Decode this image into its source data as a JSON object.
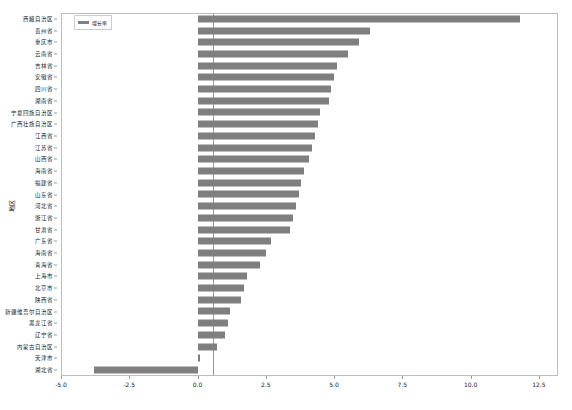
{
  "chart_data": {
    "type": "bar",
    "orientation": "horizontal",
    "title": "",
    "xlabel": "",
    "ylabel": "地区",
    "xlim": [
      -5.0,
      13.2
    ],
    "xticks": [
      "-5.0",
      "-2.5",
      "0.0",
      "2.5",
      "5.0",
      "7.5",
      "10.0",
      "12.5"
    ],
    "xtick_values": [
      -5.0,
      -2.5,
      0.0,
      2.5,
      5.0,
      7.5,
      10.0,
      12.5
    ],
    "grid": false,
    "legend": {
      "position": "upper left",
      "entries": [
        {
          "label": "增长率",
          "color": "#7f7f7f"
        }
      ]
    },
    "bar_color": "#7f7f7f",
    "categories": [
      "西藏自治区",
      "贵州省",
      "重庆市",
      "云南省",
      "吉林省",
      "安徽省",
      "四川省",
      "湖南省",
      "宁夏回族自治区",
      "广西壮族自治区",
      "江西省",
      "江苏省",
      "山西省",
      "海南省",
      "福建省",
      "山东省",
      "河北省",
      "浙江省",
      "甘肃省",
      "广东省",
      "海南省",
      "青海省",
      "上海市",
      "北京市",
      "陕西省",
      "新疆维吾尔自治区",
      "黑龙江省",
      "辽宁省",
      "内蒙古自治区",
      "天津市",
      "湖北省"
    ],
    "values": [
      11.8,
      6.3,
      5.9,
      5.5,
      5.1,
      5.0,
      4.9,
      4.8,
      4.5,
      4.4,
      4.3,
      4.2,
      4.1,
      3.9,
      3.8,
      3.7,
      3.6,
      3.5,
      3.4,
      2.7,
      2.5,
      2.3,
      1.8,
      1.7,
      1.6,
      1.2,
      1.1,
      1.0,
      0.7,
      0.1,
      -3.8
    ]
  }
}
